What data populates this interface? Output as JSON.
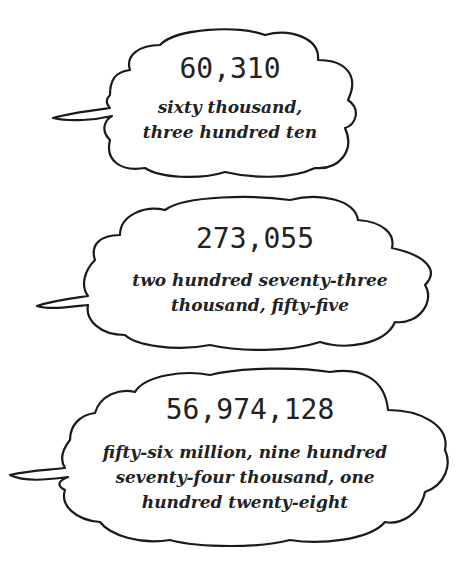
{
  "bubbles": [
    {
      "number": "60,310",
      "words": [
        "sixty thousand,",
        "three hundred ten"
      ]
    },
    {
      "number": "273,055",
      "words": [
        "two hundred seventy-three",
        "thousand, fifty-five"
      ]
    },
    {
      "number": "56,974,128",
      "words": [
        "fifty-six million, nine hundred",
        "seventy-four thousand, one",
        "hundred twenty-eight"
      ]
    }
  ]
}
